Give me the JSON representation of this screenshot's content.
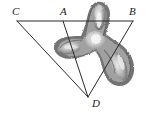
{
  "figure": {
    "background_color": "#ffffff",
    "line_color": "#2b2b2b",
    "label_color": "#1a1a1a",
    "width": 148,
    "height": 118
  },
  "labels": {
    "c": "C",
    "a": "A",
    "b": "B",
    "d": "D"
  },
  "points": {
    "C": {
      "x": 17,
      "y": 21
    },
    "A": {
      "x": 63,
      "y": 21
    },
    "B": {
      "x": 133,
      "y": 21
    },
    "D": {
      "x": 88,
      "y": 97
    }
  },
  "segments": [
    {
      "name": "CB",
      "from": "C",
      "to": "B"
    },
    {
      "name": "CD",
      "from": "C",
      "to": "D"
    },
    {
      "name": "AD",
      "from": "A",
      "to": "D"
    },
    {
      "name": "BD",
      "from": "B",
      "to": "D"
    }
  ],
  "blob": {
    "name": "tri-lobed-shaded-region",
    "description": "Irregular grayscale three-lobed propeller shape overlapping the upper-right of the triangle",
    "fill_outer": "#6f6f6f",
    "fill_inner": "#c9c9c9",
    "fill_highlight": "#efefef",
    "lobes": [
      {
        "name": "upper-lobe",
        "cx": 99,
        "cy": 16
      },
      {
        "name": "left-lobe",
        "cx": 66,
        "cy": 50
      },
      {
        "name": "lower-right-lobe",
        "cx": 120,
        "cy": 68
      }
    ]
  }
}
